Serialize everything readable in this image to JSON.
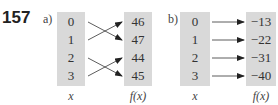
{
  "question_number": "157",
  "parts": [
    {
      "label": "a)",
      "domain_values": [
        "0",
        "1",
        "2",
        "3"
      ],
      "range_values": [
        "46",
        "47",
        "44",
        "45"
      ],
      "mapping": [
        [
          0,
          1
        ],
        [
          1,
          0
        ],
        [
          2,
          3
        ],
        [
          3,
          2
        ]
      ],
      "x_label": "x",
      "fx_label": "f(x)"
    },
    {
      "label": "b)",
      "domain_values": [
        "0",
        "1",
        "2",
        "3"
      ],
      "range_values": [
        "−13",
        "−22",
        "−31",
        "−40"
      ],
      "mapping": [
        [
          0,
          0
        ],
        [
          1,
          1
        ],
        [
          2,
          2
        ],
        [
          3,
          3
        ]
      ],
      "x_label": "x",
      "fx_label": "f(x)"
    }
  ]
}
